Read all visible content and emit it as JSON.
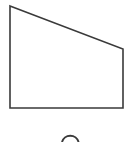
{
  "figure": {
    "type": "geometry-figure",
    "background_color": "#ffffff",
    "stroke_color": "#3a3a3a",
    "fill_color": "#ffffff",
    "canvas": {
      "width": 134,
      "height": 142
    },
    "shapes": [
      {
        "name": "quadrilateral",
        "kind": "polygon",
        "sides": 4,
        "description": "irregular quadrilateral with slanted top edge",
        "stroke_width": 1.6,
        "points": "10,6 123,49 123,108 10,108",
        "vertices": [
          {
            "label": "top-left",
            "x": 10,
            "y": 6
          },
          {
            "label": "top-right",
            "x": 123,
            "y": 49
          },
          {
            "label": "bottom-right",
            "x": 123,
            "y": 108
          },
          {
            "label": "bottom-left",
            "x": 10,
            "y": 108
          }
        ]
      },
      {
        "name": "arc",
        "kind": "arc",
        "description": "top of a circle cut off by the bottom image edge",
        "stroke_width": 2.0,
        "path": "M 62 142 A 8.6 8.6 0 0 1 78.6 142",
        "center_x": 70,
        "center_y": 143,
        "radius": 8.6
      }
    ]
  }
}
